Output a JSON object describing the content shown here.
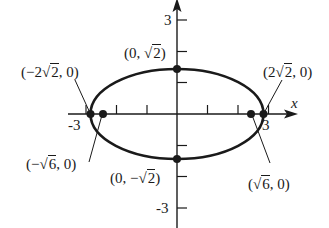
{
  "diagram": {
    "type": "ellipse-graph",
    "equation_hint": "x^2/8 + y^2/2 = 1",
    "axes": {
      "x_label": "x",
      "y_label": "y",
      "x_ticks": [
        "-3",
        "3"
      ],
      "y_ticks": [
        "3",
        "-3"
      ]
    },
    "labels": {
      "left_vertex": "(−2√2, 0)",
      "left_vertex_parts": {
        "open": "(−2",
        "radicand": "2",
        "close": ", 0)"
      },
      "top_point": "(0, √2)",
      "top_point_parts": {
        "open": "(0, ",
        "radicand": "2",
        "close": ")"
      },
      "right_vertex": "(2√2, 0)",
      "right_vertex_parts": {
        "open": "(2",
        "radicand": "2",
        "close": ", 0)"
      },
      "left_focus": "(−√6, 0)",
      "left_focus_parts": {
        "open": "(−",
        "radicand": "6",
        "close": ", 0)"
      },
      "bottom_point": "(0, −√2)",
      "bottom_point_parts": {
        "open": "(0, −",
        "radicand": "2",
        "close": ")"
      },
      "right_focus": "(√6, 0)",
      "right_focus_parts": {
        "open": "(",
        "radicand": "6",
        "close": ", 0)"
      }
    },
    "points": [
      {
        "name": "left-vertex",
        "x": -2.828,
        "y": 0
      },
      {
        "name": "right-vertex",
        "x": 2.828,
        "y": 0
      },
      {
        "name": "top-point",
        "x": 0,
        "y": 1.414
      },
      {
        "name": "bottom-point",
        "x": 0,
        "y": -1.414
      },
      {
        "name": "left-focus",
        "x": -2.449,
        "y": 0
      },
      {
        "name": "right-focus",
        "x": 2.449,
        "y": 0
      }
    ],
    "colors": {
      "ink": "#1a1a1a",
      "background": "#ffffff"
    }
  }
}
